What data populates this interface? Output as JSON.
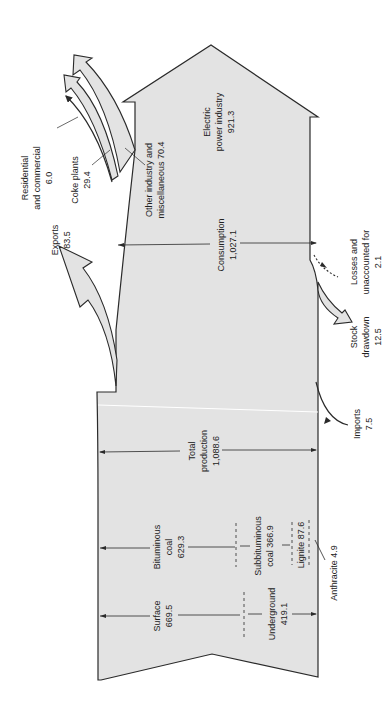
{
  "diagram": {
    "type": "coal-flow",
    "orientation": "rotated-90-ccw",
    "colors": {
      "fill": "#e3e3e3",
      "stroke": "#2a2a2a",
      "text": "#222222",
      "background": "#ffffff"
    }
  },
  "supply": {
    "surface": {
      "label": "Surface",
      "value": "669.5"
    },
    "underground": {
      "label": "Underground",
      "value": "419.1"
    },
    "bituminous": {
      "label1": "Bituminous",
      "label2": "coal",
      "value": "629.3"
    },
    "subbituminous": {
      "label1": "Subbituminous",
      "label2": "coal 366.9"
    },
    "lignite": {
      "label": "Lignite 87.6"
    },
    "anthracite": {
      "label": "Anthracite 4.9"
    },
    "total_production": {
      "label1": "Total",
      "label2": "production",
      "value": "1,088.6"
    },
    "imports": {
      "label": "Imports",
      "value": "7.5"
    },
    "stock_drawdown": {
      "label1": "Stock",
      "label2": "drawdown",
      "value": "12.5"
    },
    "losses": {
      "label1": "Losses and",
      "label2": "unaccounted for",
      "value": "2.1"
    }
  },
  "disposition": {
    "exports": {
      "label": "Exports",
      "value": "83.5"
    },
    "consumption": {
      "label": "Consumption",
      "value": "1,027.1"
    },
    "electric_power": {
      "label1": "Electric",
      "label2": "power industry",
      "value": "921.3"
    },
    "other_industry": {
      "label1": "Other industry and",
      "label2": "miscellaneous 70.4"
    },
    "coke_plants": {
      "label": "Coke plants",
      "value": "29.4"
    },
    "residential": {
      "label1": "Residential",
      "label2": "and commercial",
      "value": "6.0"
    }
  }
}
